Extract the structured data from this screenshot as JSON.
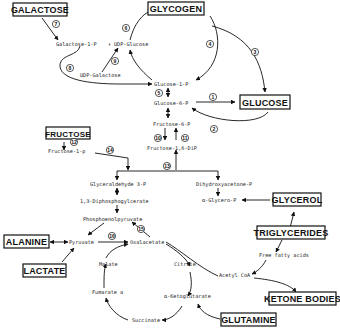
{
  "diagram": {
    "type": "metabolic-pathway",
    "boxed_nodes": {
      "galactose": "GALACTOSE",
      "glycogen": "GLYCOGEN",
      "glucose": "GLUCOSE",
      "fructose": "FRUCTOSE",
      "glycerol": "GLYCEROL",
      "triglycerides": "TRIGLYCERIDES",
      "alanine": "ALANINE",
      "lactate": "LACTATE",
      "ketone_bodies": "KETONE BODIES",
      "glutamine": "GLUTAMINE"
    },
    "intermediates": {
      "galactose_1_p": "Galactose-1-P",
      "plus": "+",
      "udp_glucose": "UDP-Glucose",
      "udp_galactose": "UDP-Galactose",
      "glucose_1_p": "Glucose-1-P",
      "glucose_6_p": "Glucose-6-P",
      "fructose_6_p": "Fructose-6-P",
      "fructose_1_6_dip": "Fructose-1,6-DiP",
      "fructose_1_p": "Fructose-1-p",
      "glyceraldehyde_3_p": "Glyceraldehyde 3-P",
      "dihydroxyacetone_p": "Dihydroxyacetone-P",
      "diphosphoglycerate": "1,3-Diphosphogylcerate",
      "alpha_glycero_p": "α-Glycero-P",
      "phosphoenolpyruvate": "Phosphoenolpyruvate",
      "pyruvate": "Pyruvate",
      "oxalacetate": "Oxalacetate",
      "malate": "Malate",
      "citrate": "Citrate",
      "fumarate": "Fumarate a",
      "alpha_ketoglutarate": "α-Ketoglutarate",
      "succinate": "Succinate",
      "acetyl_coa": "Acetyl CoA",
      "free_fatty_acids": "Free fatty acids"
    },
    "reaction_numbers": [
      "1",
      "2",
      "3",
      "4",
      "5",
      "6",
      "7",
      "8",
      "9",
      "10",
      "11",
      "12",
      "13",
      "14",
      "15",
      "16"
    ]
  }
}
